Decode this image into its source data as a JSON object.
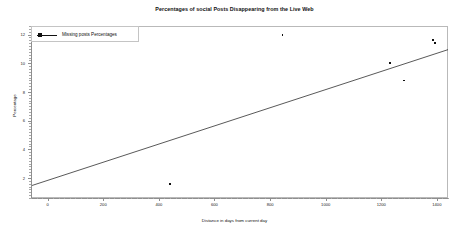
{
  "chart_data": {
    "type": "scatter",
    "title": "Percentages of social Posts Disappearing from the Live Web",
    "xlabel": "Distance in days from current day",
    "ylabel": "Percentage",
    "xlim": [
      -60,
      1440
    ],
    "ylim": [
      0.6,
      12.6
    ],
    "xticks": [
      0,
      200,
      400,
      600,
      800,
      1000,
      1200,
      1400
    ],
    "xticklabels": [
      "0",
      "200",
      "400",
      "600",
      "800",
      "1000",
      "1200",
      "1400"
    ],
    "yticks": [
      2,
      4,
      6,
      8,
      10,
      12
    ],
    "yticklabels": [
      "2",
      "4",
      "6",
      "8",
      "10",
      "12"
    ],
    "grid": false,
    "legend_position": "upper-left",
    "legend": [
      "Missing posts Percentages"
    ],
    "series": [
      {
        "name": "Missing posts Percentages",
        "marker": "square",
        "color": "#111111",
        "points": [
          {
            "x": 440,
            "y": 1.6
          },
          {
            "x": 845,
            "y": 12.0
          },
          {
            "x": 1230,
            "y": 10.0
          },
          {
            "x": 1282,
            "y": 8.8
          },
          {
            "x": 1385,
            "y": 11.6
          },
          {
            "x": 1392,
            "y": 11.4
          }
        ]
      },
      {
        "name": "trend-line",
        "type": "line",
        "color": "#111111",
        "points": [
          {
            "x": -60,
            "y": 1.45
          },
          {
            "x": 1440,
            "y": 10.95
          }
        ]
      }
    ]
  },
  "legend": {
    "label": "Missing posts Percentages"
  },
  "axes": {
    "title": "Percentages of social Posts Disappearing from the Live Web",
    "xlabel": "Distance in days from current day",
    "ylabel": "Percentage"
  }
}
